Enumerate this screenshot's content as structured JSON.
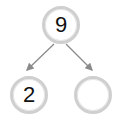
{
  "diagram": {
    "type": "number-bond",
    "whole": "9",
    "parts": [
      "2",
      ""
    ],
    "colors": {
      "ring": "#cfcfcf",
      "arrow": "#8a8a8a",
      "text": "#111111"
    }
  }
}
